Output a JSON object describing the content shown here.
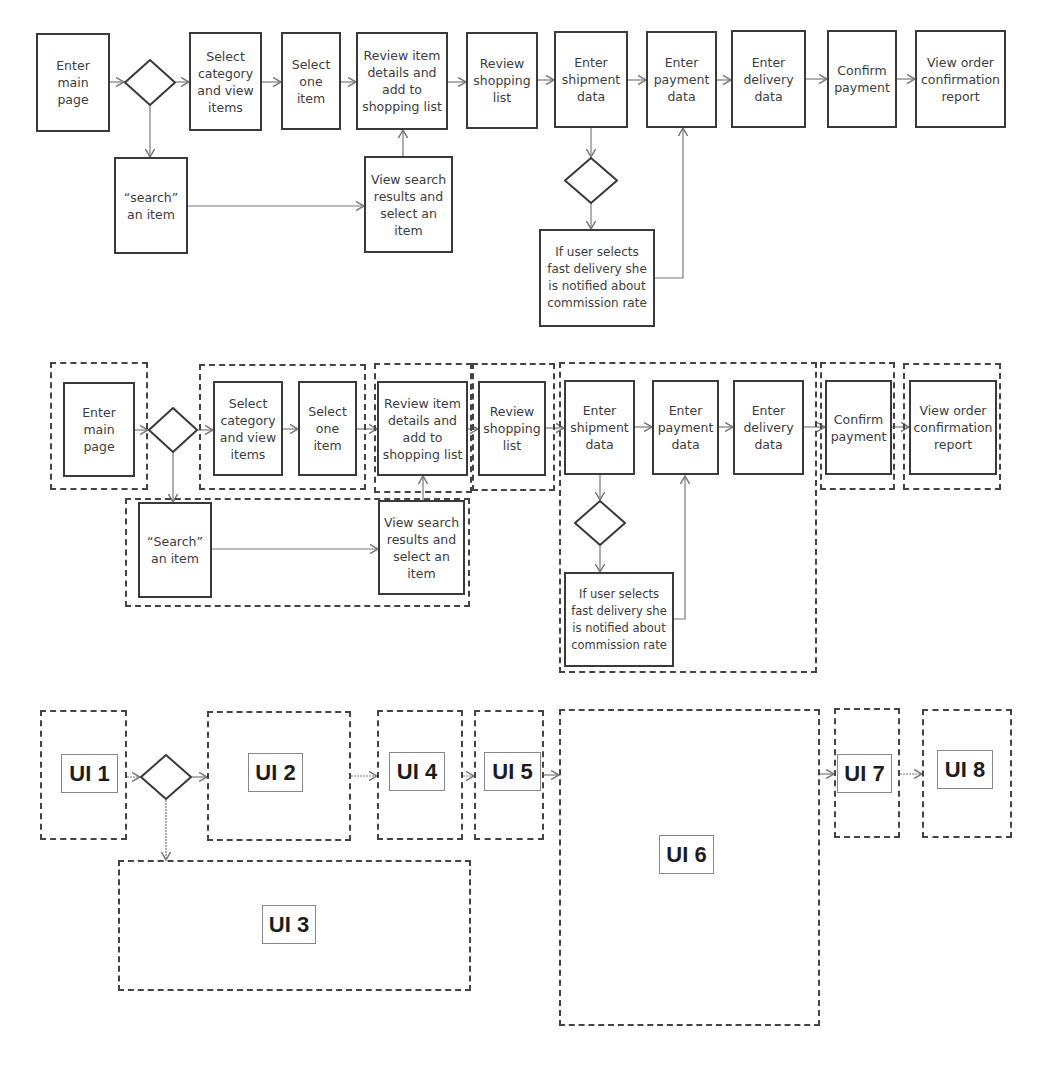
{
  "diagrams": {
    "top": {
      "steps": [
        {
          "id": "enter-main-page",
          "label": "Enter\nmain\npage"
        },
        {
          "id": "select-category",
          "label": "Select\ncategory\nand view\nitems"
        },
        {
          "id": "select-one-item",
          "label": "Select\none\nitem"
        },
        {
          "id": "review-item",
          "label": "Review item\ndetails and\nadd to\nshopping list"
        },
        {
          "id": "review-shopping-list",
          "label": "Review\nshopping\nlist"
        },
        {
          "id": "enter-shipment",
          "label": "Enter\nshipment\ndata"
        },
        {
          "id": "enter-payment",
          "label": "Enter\npayment\ndata"
        },
        {
          "id": "enter-delivery",
          "label": "Enter\ndelivery\ndata"
        },
        {
          "id": "confirm-payment",
          "label": "Confirm\npayment"
        },
        {
          "id": "view-order",
          "label": "View  order\nconfirmation\nreport"
        },
        {
          "id": "search-item",
          "label": "“search”\nan item"
        },
        {
          "id": "view-search-results",
          "label": "View search\nresults and\nselect an\nitem"
        },
        {
          "id": "fast-delivery-note",
          "label": "If user selects\nfast delivery she\nis notified about\ncommission rate"
        }
      ]
    },
    "middle": {
      "steps": [
        {
          "id": "enter-main-page",
          "label": "Enter\nmain\npage"
        },
        {
          "id": "select-category",
          "label": "Select\ncategory\nand view\nitems"
        },
        {
          "id": "select-one-item",
          "label": "Select\none\nitem"
        },
        {
          "id": "review-item",
          "label": "Review item\ndetails and\nadd to\nshopping list"
        },
        {
          "id": "review-shopping-list",
          "label": "Review\nshopping\nlist"
        },
        {
          "id": "enter-shipment",
          "label": "Enter\nshipment\ndata"
        },
        {
          "id": "enter-payment",
          "label": "Enter\npayment\ndata"
        },
        {
          "id": "enter-delivery",
          "label": "Enter\ndelivery\ndata"
        },
        {
          "id": "confirm-payment",
          "label": "Confirm\npayment"
        },
        {
          "id": "view-order",
          "label": "View  order\nconfirmation\nreport"
        },
        {
          "id": "search-item",
          "label": "“Search”\nan item"
        },
        {
          "id": "view-search-results",
          "label": "View search\nresults and\nselect an\nitem"
        },
        {
          "id": "fast-delivery-note",
          "label": "If user selects\nfast delivery she\nis notified about\ncommission rate"
        }
      ]
    },
    "bottom": {
      "ui_labels": [
        "UI 1",
        "UI 2",
        "UI 3",
        "UI 4",
        "UI 5",
        "UI 6",
        "UI 7",
        "UI 8"
      ]
    }
  },
  "colors": {
    "stroke": "#3a3a3a",
    "dashed": "#444444",
    "text": "#3d3d3d",
    "background": "#ffffff"
  }
}
